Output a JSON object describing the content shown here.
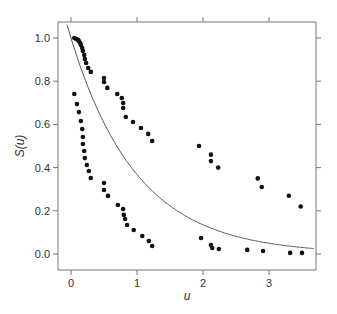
{
  "chart_data": {
    "type": "scatter",
    "title": "",
    "xlabel": "u",
    "ylabel": "S(u)",
    "xlim": [
      -0.2,
      3.7
    ],
    "ylim": [
      -0.07,
      1.07
    ],
    "xticks": [
      0,
      1,
      2,
      3
    ],
    "yticks": [
      0.0,
      0.2,
      0.4,
      0.6,
      0.8,
      1.0
    ],
    "xtick_labels": [
      "0",
      "1",
      "2",
      "3"
    ],
    "ytick_labels": [
      "0.0",
      "0.2",
      "0.4",
      "0.6",
      "0.8",
      "1.0"
    ],
    "grid": false,
    "series": [
      {
        "name": "upper",
        "type": "scatter",
        "points": [
          [
            0.05,
            1.0
          ],
          [
            0.08,
            0.995
          ],
          [
            0.11,
            0.99
          ],
          [
            0.12,
            0.985
          ],
          [
            0.14,
            0.977
          ],
          [
            0.15,
            0.968
          ],
          [
            0.17,
            0.954
          ],
          [
            0.18,
            0.94
          ],
          [
            0.2,
            0.921
          ],
          [
            0.21,
            0.903
          ],
          [
            0.23,
            0.884
          ],
          [
            0.26,
            0.861
          ],
          [
            0.3,
            0.843
          ],
          [
            0.5,
            0.815
          ],
          [
            0.5,
            0.796
          ],
          [
            0.55,
            0.769
          ],
          [
            0.7,
            0.741
          ],
          [
            0.77,
            0.722
          ],
          [
            0.79,
            0.699
          ],
          [
            0.79,
            0.676
          ],
          [
            0.83,
            0.634
          ],
          [
            0.94,
            0.611
          ],
          [
            1.06,
            0.583
          ],
          [
            1.17,
            0.556
          ],
          [
            1.23,
            0.523
          ],
          [
            1.94,
            0.5
          ],
          [
            2.12,
            0.46
          ],
          [
            2.12,
            0.43
          ],
          [
            2.23,
            0.4
          ],
          [
            2.83,
            0.35
          ],
          [
            2.89,
            0.31
          ],
          [
            3.3,
            0.27
          ],
          [
            3.48,
            0.22
          ]
        ]
      },
      {
        "name": "lower",
        "type": "scatter",
        "points": [
          [
            0.05,
            0.741
          ],
          [
            0.09,
            0.694
          ],
          [
            0.12,
            0.657
          ],
          [
            0.15,
            0.616
          ],
          [
            0.17,
            0.579
          ],
          [
            0.18,
            0.542
          ],
          [
            0.18,
            0.509
          ],
          [
            0.2,
            0.477
          ],
          [
            0.21,
            0.444
          ],
          [
            0.24,
            0.412
          ],
          [
            0.27,
            0.384
          ],
          [
            0.3,
            0.352
          ],
          [
            0.5,
            0.329
          ],
          [
            0.5,
            0.296
          ],
          [
            0.56,
            0.269
          ],
          [
            0.71,
            0.227
          ],
          [
            0.79,
            0.208
          ],
          [
            0.8,
            0.181
          ],
          [
            0.82,
            0.162
          ],
          [
            0.85,
            0.134
          ],
          [
            0.95,
            0.111
          ],
          [
            1.08,
            0.083
          ],
          [
            1.18,
            0.06
          ],
          [
            1.23,
            0.037
          ],
          [
            1.97,
            0.074
          ],
          [
            2.12,
            0.042
          ],
          [
            2.14,
            0.028
          ],
          [
            2.24,
            0.023
          ],
          [
            2.67,
            0.019
          ],
          [
            2.91,
            0.014
          ],
          [
            3.32,
            0.005
          ],
          [
            3.5,
            0.005
          ]
        ]
      },
      {
        "name": "exp(-u)",
        "type": "line",
        "function": "S(u) = exp(-u)"
      }
    ]
  },
  "plot": {
    "px": {
      "x0": 71,
      "xscale": 66,
      "y0": 254,
      "yscale": 216,
      "frame": {
        "left": 58,
        "top": 22,
        "right": 316,
        "bottom": 270
      }
    },
    "colors": {
      "points": "#111111",
      "curve": "#555555",
      "frame": "#777777",
      "text": "#333333"
    }
  }
}
